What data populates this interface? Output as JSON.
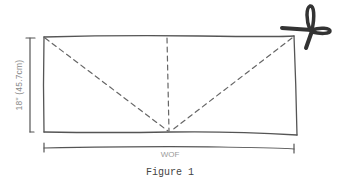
{
  "figure": {
    "caption": "Figure 1",
    "height_label": "18\" (45.7cm)",
    "width_label": "WOF",
    "icon": "scissors-icon"
  },
  "colors": {
    "line": "#555555",
    "dashed": "#666666",
    "label": "#8a8a8a",
    "scissors": "#333333"
  }
}
